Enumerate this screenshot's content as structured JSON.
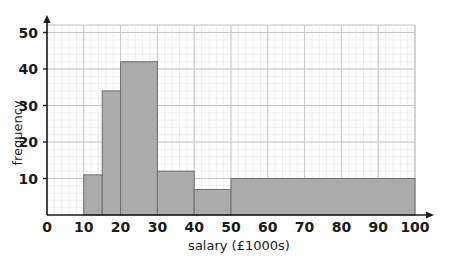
{
  "chart_data": {
    "type": "bar",
    "title": "",
    "subtitle": "",
    "xlabel": "salary (£1000s)",
    "ylabel": "frequency",
    "xlim": [
      0,
      100
    ],
    "ylim": [
      0,
      52
    ],
    "xticks": [
      0,
      10,
      20,
      30,
      40,
      50,
      60,
      70,
      80,
      90,
      100
    ],
    "xtick_labels": [
      "0",
      "10",
      "20",
      "30",
      "40",
      "50",
      "60",
      "70",
      "80",
      "90",
      "100"
    ],
    "yticks": [
      10,
      20,
      30,
      40,
      50
    ],
    "ytick_labels": [
      "10",
      "20",
      "30",
      "40",
      "50"
    ],
    "grid": true,
    "grid_minor": true,
    "legend": null,
    "bar_fill": "#ababab",
    "bar_stroke": "#6e6e6e",
    "axis_color": "#1a1a1a",
    "grid_major_color": "#c8c8c8",
    "grid_minor_color": "#e6e6e6",
    "bins": [
      {
        "label": "10-15",
        "start": 10,
        "end": 15,
        "frequency": 11
      },
      {
        "label": "15-20",
        "start": 15,
        "end": 20,
        "frequency": 34
      },
      {
        "label": "20-30",
        "start": 20,
        "end": 30,
        "frequency": 42
      },
      {
        "label": "30-40",
        "start": 30,
        "end": 40,
        "frequency": 12
      },
      {
        "label": "40-50",
        "start": 40,
        "end": 50,
        "frequency": 7
      },
      {
        "label": "50-100",
        "start": 50,
        "end": 100,
        "frequency": 10
      }
    ],
    "categories": [
      "10-15",
      "15-20",
      "20-30",
      "30-40",
      "40-50",
      "50-100"
    ],
    "values": [
      11,
      34,
      42,
      12,
      7,
      10
    ]
  }
}
